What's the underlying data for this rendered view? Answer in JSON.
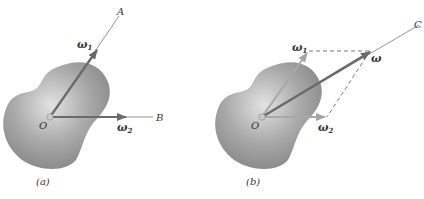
{
  "figure": {
    "panel_a": {
      "caption": "(a)",
      "origin_label": "O",
      "axis_a_label": "A",
      "axis_b_label": "B",
      "omega1_label": "ω",
      "omega1_sub": "1",
      "omega2_label": "ω",
      "omega2_sub": "2"
    },
    "panel_b": {
      "caption": "(b)",
      "origin_label": "O",
      "axis_c_label": "C",
      "omega_label": "ω",
      "omega1_label": "ω",
      "omega1_sub": "1",
      "omega2_label": "ω",
      "omega2_sub": "2"
    },
    "colors": {
      "body_light": "#d4d4d4",
      "body_dark": "#8a8a8a",
      "vector_dark": "#6a6a6a",
      "vector_light": "#a8a8a8",
      "axis_line": "#777777",
      "dashed": "#777777"
    }
  }
}
